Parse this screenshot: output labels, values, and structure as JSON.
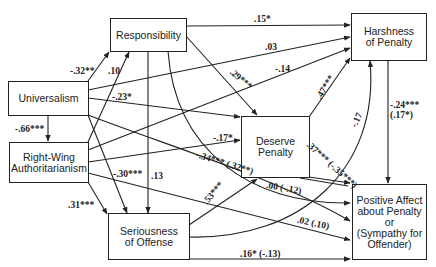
{
  "nodes": {
    "responsibility": "Responsibility",
    "harshness": "Harshness\nof Penalty",
    "universalism": "Universalism",
    "deserve": "Deserve\nPenalty",
    "rwa": "Right-Wing\nAuthoritarianism",
    "seriousness": "Seriousness\nof Offense",
    "positive_affect": "Positive Affect\nabout Penalty\nor\n(Sympathy for\nOffender)"
  },
  "paths": [
    {
      "from": "Universalism",
      "to": "Responsibility",
      "coef": "-.32**"
    },
    {
      "from": "Right-Wing Authoritarianism",
      "to": "Responsibility",
      "coef": ".10"
    },
    {
      "from": "Universalism",
      "to": "Right-Wing Authoritarianism",
      "coef": "-.66***"
    },
    {
      "from": "Responsibility",
      "to": "Harshness of Penalty",
      "coef": ".15*"
    },
    {
      "from": "Universalism",
      "to": "Harshness of Penalty",
      "coef": ".03"
    },
    {
      "from": "Right-Wing Authoritarianism",
      "to": "Harshness of Penalty",
      "coef": "-.14"
    },
    {
      "from": "Responsibility",
      "to": "Deserve Penalty",
      "coef": ".29***"
    },
    {
      "from": "Universalism",
      "to": "Deserve Penalty",
      "coef": "-.23*"
    },
    {
      "from": "Right-Wing Authoritarianism",
      "to": "Deserve Penalty",
      "coef": "-.17*"
    },
    {
      "from": "Deserve Penalty",
      "to": "Harshness of Penalty",
      "coef": ".47***"
    },
    {
      "from": "Seriousness of Offense",
      "to": "Harshness of Penalty",
      "coef": "-.17"
    },
    {
      "from": "Harshness of Penalty",
      "to": "Positive Affect",
      "coef": "-.24***\n(.17*)"
    },
    {
      "from": "Universalism",
      "to": "Seriousness of Offense",
      "coef": "-.30***"
    },
    {
      "from": "Responsibility",
      "to": "Seriousness of Offense",
      "coef": ".13"
    },
    {
      "from": "Right-Wing Authoritarianism",
      "to": "Seriousness of Offense",
      "coef": ".31***"
    },
    {
      "from": "Seriousness of Offense",
      "to": "Deserve Penalty",
      "coef": ".53***"
    },
    {
      "from": "Universalism",
      "to": "Positive Affect",
      "coef": "-.34*** (.32**)"
    },
    {
      "from": "Responsibility",
      "to": "Positive Affect",
      "coef": ".00 (-.12)"
    },
    {
      "from": "Deserve Penalty",
      "to": "Positive Affect",
      "coef": ".37*** (-.35***)"
    },
    {
      "from": "Right-Wing Authoritarianism",
      "to": "Positive Affect",
      "coef": ".02 (.10)"
    },
    {
      "from": "Seriousness of Offense",
      "to": "Positive Affect",
      "coef": ".16* (-.13)"
    }
  ],
  "labels": {
    "u_resp": "-.32**",
    "rwa_resp": ".10",
    "u_rwa": "-.66***",
    "resp_harsh": ".15*",
    "u_harsh": ".03",
    "rwa_harsh": "-.14",
    "resp_deserve": ".29***",
    "u_deserve": "-.23*",
    "rwa_deserve": "-.17*",
    "deserve_harsh": ".47***",
    "ser_harsh": "-.17",
    "harsh_pa_1": "-.24***",
    "harsh_pa_2": "(.17*)",
    "u_ser": "-.30***",
    "resp_ser": ".13",
    "rwa_ser": ".31***",
    "ser_deserve": ".53***",
    "u_pa": "-.34*** (.32**)",
    "resp_pa": ".00 (-.12)",
    "deserve_pa": ".37*** (-.35***)",
    "rwa_pa": ".02 (.10)",
    "ser_pa": ".16* (-.13)"
  }
}
